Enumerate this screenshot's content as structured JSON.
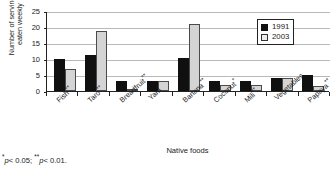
{
  "chart_data": {
    "type": "bar",
    "title": "",
    "xlabel": "Native foods",
    "ylabel": "Number of servings\neaten weekly",
    "ylim": [
      0,
      25
    ],
    "yticks": [
      0,
      5,
      10,
      15,
      20,
      25
    ],
    "grid": true,
    "legend_position": "top-right",
    "categories": [
      "Fish**",
      "Taro**",
      "Breadfruit**",
      "Yam",
      "Banana**",
      "Coconut*",
      "Mili**",
      "Vegetables",
      "Papaya**"
    ],
    "series": [
      {
        "name": "1991",
        "color": "#101010",
        "values": [
          10,
          11.3,
          3,
          3,
          10.3,
          3,
          3,
          4,
          5
        ]
      },
      {
        "name": "2003",
        "color": "#d4d4d4",
        "values": [
          7,
          18.8,
          0.6,
          3,
          21,
          2,
          2,
          4,
          1.5
        ]
      }
    ]
  },
  "legend": {
    "items": [
      {
        "label": "1991"
      },
      {
        "label": "2003"
      }
    ]
  },
  "footnote": {
    "star1": "*",
    "text1": "p",
    "value1": "< 0.05; ",
    "star2": "**",
    "text2": "p",
    "value2": "< 0.01."
  }
}
